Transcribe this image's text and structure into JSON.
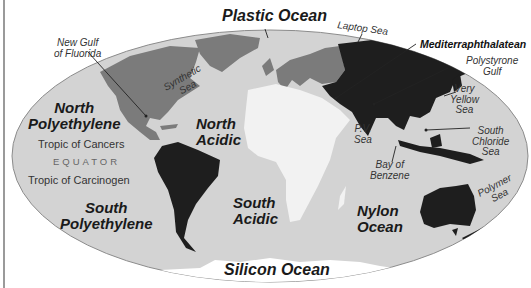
{
  "map": {
    "colors": {
      "background": "#ffffff",
      "ocean": "#d3d3d3",
      "ocean_outline": "#8c8c8c",
      "north_america_europe": "#7b7b7b",
      "asia_south_america_australia": "#1e1e1e",
      "africa": "#f2f2f2",
      "antarctica": "#ffffff",
      "label_text": "#1a1a1a"
    },
    "oceans": {
      "plastic_ocean": "Plastic Ocean",
      "north_polyethylene": [
        "North",
        "Polyethylene"
      ],
      "south_polyethylene": [
        "South",
        "Polyethylene"
      ],
      "north_acidic": [
        "North",
        "Acidic"
      ],
      "south_acidic": [
        "South",
        "Acidic"
      ],
      "nylon_ocean": [
        "Nylon",
        "Ocean"
      ],
      "silicon_ocean": "Silicon Ocean"
    },
    "seas": {
      "new_gulf_of_fluorida": [
        "New Gulf",
        "of Fluorida"
      ],
      "synthetic_sea": [
        "Synthetic",
        "Sea"
      ],
      "laptop_sea": "Laptop Sea",
      "mediterraphthalatean": "Mediterraphthalatean",
      "polystyrone_gulf": [
        "Polystyrone",
        "Gulf"
      ],
      "very_yellow_sea": [
        "Very",
        "Yellow",
        "Sea"
      ],
      "pv_sea": [
        "P.V.",
        "Sea"
      ],
      "bay_of_benzene": [
        "Bay of",
        "Benzene"
      ],
      "south_chloride_sea": [
        "South",
        "Chloride",
        "Sea"
      ],
      "polymer_sea": [
        "Polymer",
        "Sea"
      ]
    },
    "lines_of_latitude": {
      "tropic_north": "Tropic of Cancers",
      "equator": "EQUATOR",
      "tropic_south": "Tropic of Carcinogen"
    }
  }
}
